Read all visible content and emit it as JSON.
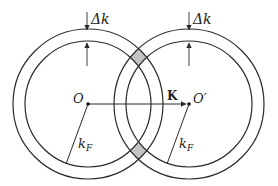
{
  "diagram": {
    "colors": {
      "stroke": "#2a2a2a",
      "overlap_fill": "#c4c4c4",
      "background": "#ffffff"
    },
    "circles": [
      {
        "id": "left",
        "center_label": "O",
        "radius_label": "k",
        "radius_sub": "F",
        "shell_label": "Δk"
      },
      {
        "id": "right",
        "center_label": "O′",
        "radius_label": "k",
        "radius_sub": "F",
        "shell_label": "Δk"
      }
    ],
    "vector_label": "K"
  }
}
